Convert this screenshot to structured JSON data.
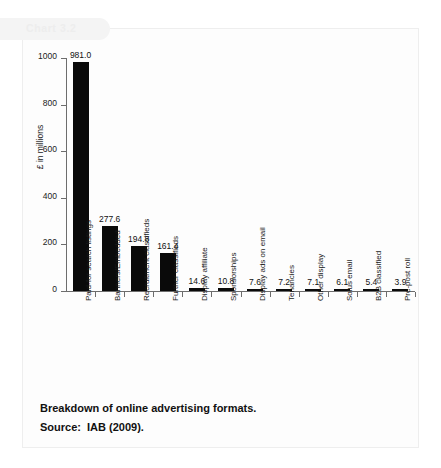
{
  "page": {
    "chart_tab_label": "Chart 3.2",
    "caption_title": "Breakdown of online advertising formats.",
    "caption_source": "Source:  IAB (2009)."
  },
  "chart_data": {
    "type": "bar",
    "title": "Breakdown of online advertising formats.",
    "xlabel": "",
    "ylabel": "£ in millions",
    "ylim": [
      0,
      1000
    ],
    "yticks": [
      0,
      200,
      400,
      600,
      800,
      1000
    ],
    "ytick_labels": [
      "0",
      "200",
      "400",
      "600",
      "800",
      "1000"
    ],
    "grid": false,
    "legend": false,
    "bar_color": "#0a0a0a",
    "categories": [
      "Paid-for search listings",
      "Banners/Embedded",
      "Recruitment classifieds",
      "Further classifieds",
      "Display affiliate",
      "Sponsorships",
      "Display ads on email",
      "Tenancies",
      "Other display",
      "Solus email",
      "B2B classified",
      "Pre-post roll"
    ],
    "values": [
      981.0,
      277.6,
      194.8,
      161.4,
      14.6,
      10.8,
      7.6,
      7.2,
      7.1,
      6.1,
      5.4,
      3.9
    ],
    "value_labels": [
      "981.0",
      "277.6",
      "194.8",
      "161.4",
      "14.6",
      "10.8",
      "7.6",
      "7.2",
      "7.1",
      "6.1",
      "5.4",
      "3.9"
    ]
  }
}
